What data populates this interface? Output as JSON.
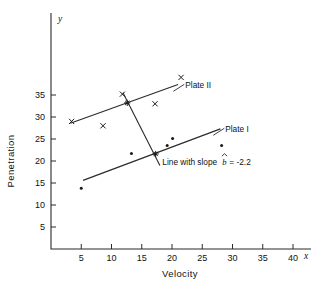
{
  "chart_data": {
    "type": "scatter",
    "title": "",
    "xlabel": "Velocity",
    "ylabel": "Penetration",
    "x_axis_variable": "x",
    "y_axis_variable": "y",
    "xlim": [
      0,
      44
    ],
    "ylim": [
      0,
      41
    ],
    "xticks": [
      5,
      10,
      15,
      20,
      25,
      30,
      35,
      40
    ],
    "yticks": [
      5,
      10,
      15,
      20,
      25,
      30,
      35
    ],
    "grid": false,
    "legend_position": "inline-annotations",
    "series": [
      {
        "name": "Plate II",
        "marker": "x",
        "points": [
          {
            "x": 3.4,
            "y": 29.0
          },
          {
            "x": 8.6,
            "y": 28.0
          },
          {
            "x": 11.8,
            "y": 35.2
          },
          {
            "x": 17.2,
            "y": 33.0
          },
          {
            "x": 21.5,
            "y": 39.0
          }
        ]
      },
      {
        "name": "Plate I",
        "marker": "dot",
        "points": [
          {
            "x": 5.0,
            "y": 13.8
          },
          {
            "x": 13.3,
            "y": 21.7
          },
          {
            "x": 19.2,
            "y": 23.5
          },
          {
            "x": 20.1,
            "y": 25.1
          },
          {
            "x": 28.2,
            "y": 23.5
          }
        ]
      }
    ],
    "fitted_lines": [
      {
        "name": "Plate II",
        "x0": 3.2,
        "y0": 28.6,
        "x1": 21.0,
        "y1": 37.4
      },
      {
        "name": "Plate I",
        "x0": 5.3,
        "y0": 15.6,
        "x1": 28.0,
        "y1": 27.3
      },
      {
        "name": "Line with slope b = -2.2",
        "x0": 11.9,
        "y0": 35.5,
        "x1": 18.0,
        "y1": 19.0
      }
    ],
    "intersection_points": [
      {
        "x": 12.6,
        "y": 33.2
      },
      {
        "x": 17.3,
        "y": 21.6
      }
    ],
    "annotations": [
      {
        "id": "plate-2",
        "text": "Plate II",
        "x": 22.2,
        "y": 37.2
      },
      {
        "id": "plate-1",
        "text": "Plate I",
        "x": 28.8,
        "y": 27.2
      },
      {
        "id": "slope-note",
        "text": "Line with slope ",
        "italic_symbol": "b",
        "hat": true,
        "value": " = -2.2",
        "x": 18.4,
        "y": 19.2
      }
    ]
  },
  "labels": {
    "xlabel": "Velocity",
    "ylabel": "Penetration",
    "x_var": "x",
    "y_var": "y",
    "plate_two": "Plate II",
    "plate_one": "Plate I",
    "slope_prefix": "Line with slope",
    "slope_symbol": "b",
    "slope_value": "= -2.2",
    "ticks_x": [
      "5",
      "10",
      "15",
      "20",
      "25",
      "30",
      "35",
      "40"
    ],
    "ticks_y": [
      "5",
      "10",
      "15",
      "20",
      "25",
      "30",
      "35"
    ]
  },
  "colors": {
    "ink": "#1a1a1a",
    "background": "#ffffff"
  }
}
